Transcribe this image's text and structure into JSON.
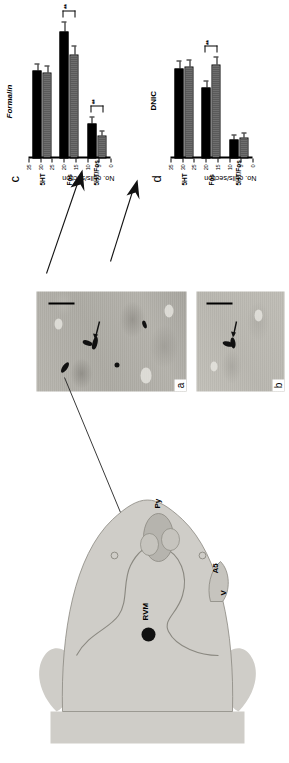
{
  "figure": {
    "panels": [
      "a",
      "b",
      "c",
      "d"
    ]
  },
  "brain_diagram": {
    "name": "brainstem-section",
    "labels": [
      {
        "id": "rvm",
        "text": "RVM"
      },
      {
        "id": "py",
        "text": "Py"
      },
      {
        "id": "a5",
        "text": "A5"
      },
      {
        "id": "v",
        "text": "V"
      }
    ]
  },
  "micrographs": [
    {
      "label": "a",
      "scale_bar": true,
      "arrows": 2
    },
    {
      "label": "b",
      "scale_bar": true,
      "arrows": 1
    }
  ],
  "annotations": {
    "formalin": "Formalin",
    "dnic": "DNIC"
  },
  "chart_data": [
    {
      "id": "c",
      "type": "bar",
      "panel_label": "c",
      "title": "Formalin",
      "xlabel": "",
      "ylabel": "No. cells/section",
      "ylim": [
        0,
        35
      ],
      "yticks": [
        0,
        5,
        10,
        15,
        20,
        25,
        30,
        35
      ],
      "ytick_labels": [
        "0",
        "5",
        "10",
        "15",
        "20",
        "25",
        "30",
        "35"
      ],
      "categories": [
        "5HT",
        "Fos",
        "5HT/Fos"
      ],
      "series": [
        {
          "name": "Control",
          "color": "#000000",
          "values": [
            21.0,
            30.5,
            8.5
          ],
          "errors": [
            1.6,
            2.2,
            1.4
          ]
        },
        {
          "name": "Formalin",
          "color": "#666666",
          "values": [
            20.5,
            25.0,
            5.5
          ],
          "errors": [
            1.5,
            1.8,
            1.0
          ]
        }
      ],
      "significance": [
        {
          "category": "Fos",
          "marker": "**"
        },
        {
          "category": "5HT/Fos",
          "marker": "**"
        }
      ]
    },
    {
      "id": "d",
      "type": "bar",
      "panel_label": "d",
      "title": "DNIC",
      "xlabel": "",
      "ylabel": "No. cells/section",
      "ylim": [
        0,
        35
      ],
      "yticks": [
        0,
        5,
        10,
        15,
        20,
        25,
        30,
        35
      ],
      "ytick_labels": [
        "0",
        "5",
        "10",
        "15",
        "20",
        "25",
        "30",
        "35"
      ],
      "categories": [
        "5HT",
        "Fos",
        "5HT/Fos"
      ],
      "series": [
        {
          "name": "Control",
          "color": "#000000",
          "values": [
            21.5,
            17.0,
            4.5
          ],
          "errors": [
            1.8,
            1.5,
            0.9
          ]
        },
        {
          "name": "DNIC",
          "color": "#666666",
          "values": [
            22.0,
            22.5,
            5.0
          ],
          "errors": [
            1.6,
            1.6,
            1.0
          ]
        }
      ],
      "significance": [
        {
          "category": "Fos",
          "marker": "**"
        }
      ]
    }
  ]
}
